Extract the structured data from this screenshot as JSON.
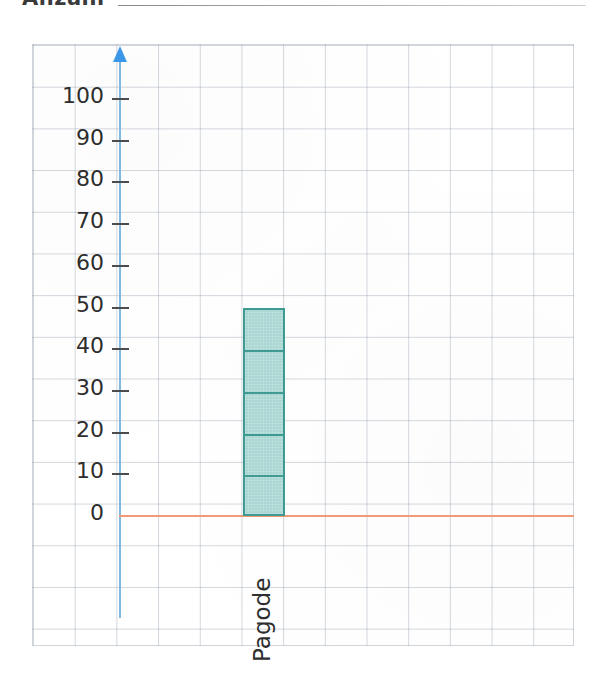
{
  "header": {
    "text": "Anzahl",
    "rule_visible": true
  },
  "chart_data": {
    "type": "bar",
    "title": "",
    "xlabel": "",
    "ylabel": "",
    "categories": [
      "Pagode"
    ],
    "values": [
      50
    ],
    "series": [
      {
        "name": "Anzahl",
        "values": [
          50
        ]
      }
    ],
    "ylim": [
      0,
      100
    ],
    "ytick_labels": [
      "100",
      "90",
      "80",
      "70",
      "60",
      "50",
      "40",
      "30",
      "20",
      "10",
      "0"
    ],
    "ytick_values": [
      100,
      90,
      80,
      70,
      60,
      50,
      40,
      30,
      20,
      10,
      0
    ],
    "ytick_step": 10,
    "grid": true,
    "grid_style": "graph-paper",
    "legend": false,
    "bar_segments": 5,
    "bar_segment_size": 10,
    "colors": {
      "bar_fill": "#a9d6d2",
      "bar_outline": "#3f9b91",
      "y_axis": "#7fb8e0",
      "y_axis_arrow": "#3d97e8",
      "x_axis": "#f09a78",
      "grid_line": "#96a0af",
      "text": "#2e2e2e"
    }
  }
}
